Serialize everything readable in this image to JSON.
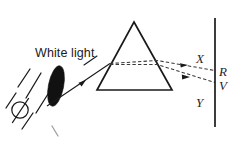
{
  "figure": {
    "background_color": "#ffffff",
    "ink_color": "#1a1a1a",
    "width": 238,
    "height": 142
  },
  "labels": {
    "white_light": "White light",
    "ray_x": "X",
    "ray_r": "R",
    "ray_v": "V",
    "ray_y": "Y"
  },
  "diagram_data": {
    "type": "optics-ray-diagram",
    "elements": [
      {
        "name": "light-source-bulb",
        "shape": "circle-with-filament-line",
        "center": [
          20,
          110
        ],
        "radius": 8
      },
      {
        "name": "source-rays",
        "shape": "diagonal-lines",
        "count": 3,
        "direction": "up-right"
      },
      {
        "name": "converging-lens",
        "shape": "filled-lens-ellipse",
        "center": [
          56,
          86
        ],
        "fill": "#111111",
        "tilt_degrees": 12
      },
      {
        "name": "incident-white-ray",
        "shape": "arrow-line",
        "from": [
          48,
          104
        ],
        "to": [
          110,
          63
        ]
      },
      {
        "name": "prism",
        "shape": "triangle",
        "apex": [
          134,
          22
        ],
        "bottom_left": [
          97,
          90
        ],
        "bottom_right": [
          172,
          90
        ]
      },
      {
        "name": "dispersed-ray-upper-red",
        "shape": "dashed-arrow-line",
        "label": "R",
        "hits_screen_at": [
          215,
          70
        ]
      },
      {
        "name": "dispersed-ray-lower-violet",
        "shape": "dashed-arrow-line",
        "label": "V",
        "hits_screen_at": [
          215,
          82
        ]
      },
      {
        "name": "screen",
        "shape": "vertical-line",
        "x": 215,
        "y_top": 18,
        "y_bottom": 127
      }
    ]
  }
}
